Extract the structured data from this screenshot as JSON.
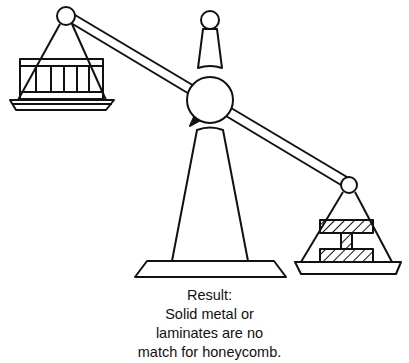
{
  "figure": {
    "stroke_color": "#111111",
    "background": "#ffffff",
    "left_load": "honeycomb-crate",
    "right_load": "solid-metal-i-beam"
  },
  "caption": {
    "lines": [
      "Result:",
      "Solid metal or",
      "laminates are no",
      "match for honeycomb."
    ]
  }
}
